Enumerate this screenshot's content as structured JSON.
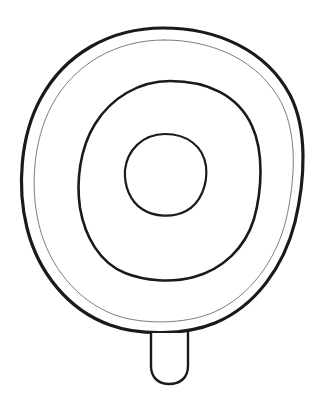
{
  "canvas": {
    "width": 331,
    "height": 410,
    "background_color": "#ffffff",
    "title": "Pan viewed from above line drawing"
  },
  "style": {
    "stroke_color": "#1a1a1a",
    "thin_stroke_color": "#6e6e6e",
    "fill_color": "none",
    "outer_stroke_width": 3.2,
    "thin_stroke_width": 0.9,
    "ring_stroke_width": 2.6,
    "center_stroke_width": 2.2,
    "handle_stroke_width": 2.4
  },
  "shapes": {
    "outer_body": {
      "name": "outer-rim",
      "center_x": 163,
      "center_y": 180,
      "radius_x": 140,
      "radius_y": 152,
      "stroke": "#1a1a1a",
      "width": 3.2
    },
    "inner_thin_rim": {
      "name": "inner-thin-rim",
      "center_x": 164,
      "center_y": 182,
      "radius_x": 130,
      "radius_y": 143,
      "stroke": "#6e6e6e",
      "width": 0.9
    },
    "middle_ring": {
      "name": "middle-ring",
      "center_x": 170,
      "center_y": 179,
      "radius_x": 91,
      "radius_y": 98,
      "stroke": "#1a1a1a",
      "width": 2.6
    },
    "center_circle": {
      "name": "center-circle",
      "center_x": 165,
      "center_y": 175,
      "radius_x": 41,
      "radius_y": 42,
      "stroke": "#1a1a1a",
      "width": 2.2
    },
    "handle": {
      "name": "handle-stem",
      "x": 151,
      "y": 330,
      "width": 37,
      "height": 55,
      "corner_radius": 17,
      "stroke": "#1a1a1a",
      "stroke_width": 2.4
    }
  },
  "artwork_paths": {
    "outer_body_d": "M 163 28 C 217 28 266 50 290 95 C 308 130 305 180 295 222 C 284 266 256 306 215 323 C 186 335 140 336 110 325 C 68 310 38 272 27 228 C 17 188 20 136 41 98 C 65 54 110 28 163 28 Z",
    "inner_thin_rim_d": "M 164 40 C 214 40 259 61 281 102 C 298 135 295 181 286 220 C 276 260 250 297 212 313 C 185 324 143 325 115 315 C 77 301 49 266 39 225 C 30 188 33 140 52 105 C 74 64 116 40 164 40 Z",
    "middle_ring_d": "M 170 81 C 207 81 238 95 252 126 C 264 152 262 190 254 219 C 245 248 223 269 194 277 C 172 283 145 281 125 273 C 100 263 85 237 80 208 C 76 181 80 148 95 124 C 111 98 139 81 170 81 Z",
    "center_circle_d": "M 165 134 C 187 134 203 146 206 166 C 208 184 201 203 186 211 C 173 218 154 217 142 209 C 130 201 124 186 125 170 C 127 151 142 134 165 134 Z",
    "handle_d": "M 151 333 L 151 366 C 151 378 159 384 169 384 C 180 384 188 378 188 366 L 188 333"
  }
}
